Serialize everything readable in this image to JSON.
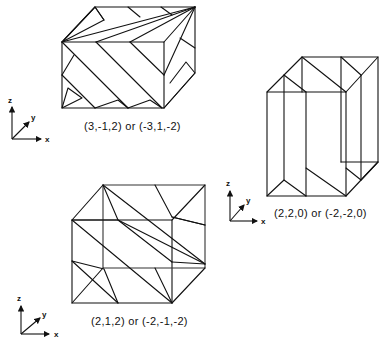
{
  "figures": [
    {
      "id": "plane-3-m1-2",
      "label": "(3,-1,2) or (-3,1,-2)",
      "axes": {
        "x": "x",
        "y": "y",
        "z": "z"
      }
    },
    {
      "id": "plane-2-2-0",
      "label": "(2,2,0) or (-2,-2,0)",
      "axes": {
        "x": "x",
        "y": "y",
        "z": "z"
      }
    },
    {
      "id": "plane-2-1-2",
      "label": "(2,1,2) or (-2,-1,-2)",
      "axes": {
        "x": "x",
        "y": "y",
        "z": "z"
      }
    }
  ],
  "colors": {
    "line": "#111111",
    "background": "#ffffff"
  }
}
